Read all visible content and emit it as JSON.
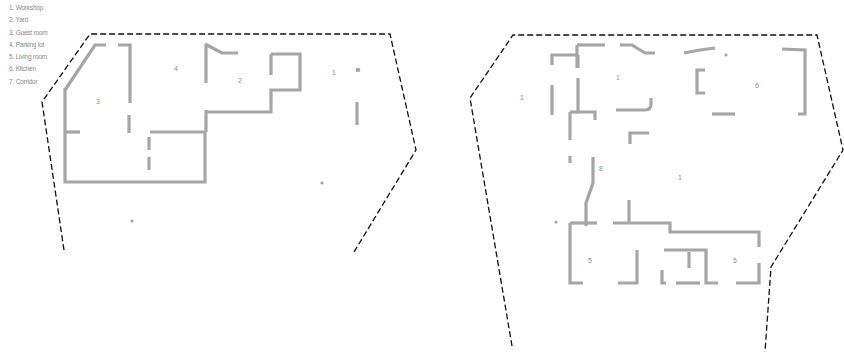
{
  "legend": {
    "items": [
      {
        "number": "1",
        "label": "1. Workshop"
      },
      {
        "number": "2",
        "label": "2. Yard"
      },
      {
        "number": "3",
        "label": "3. Guest room"
      },
      {
        "number": "4",
        "label": "4. Parking lot"
      },
      {
        "number": "5",
        "label": "5. Living room"
      },
      {
        "number": "6",
        "label": "6. Kitchen"
      },
      {
        "number": "7",
        "label": "7. Corridor"
      }
    ]
  },
  "plans": {
    "left": {
      "room_labels": {
        "workshop": "1",
        "yard": "2",
        "guest_room": "3",
        "parking_lot": "4"
      }
    },
    "right": {
      "room_labels": {
        "workshop_west": "1",
        "workshop_north": "1",
        "kitchen": "6",
        "corridor": "8",
        "workshop_center": "1",
        "living_room_west": "5",
        "living_room_east": "5"
      }
    }
  },
  "colors": {
    "walls": "#a6a6a6",
    "boundary": "#111111",
    "labels": "#8f8f8f",
    "background": "#ffffff"
  }
}
